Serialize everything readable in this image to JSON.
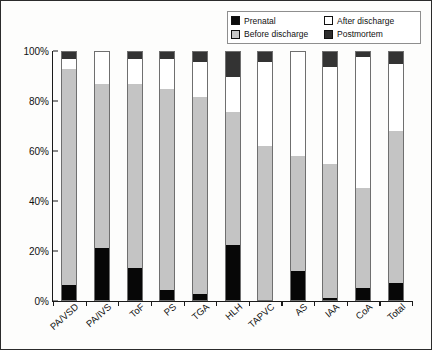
{
  "chart_data": {
    "type": "bar",
    "stacked": true,
    "stack_mode": "percent",
    "title": "",
    "xlabel": "",
    "ylabel": "",
    "ylim": [
      0,
      100
    ],
    "yticks": [
      "0%",
      "20%",
      "40%",
      "60%",
      "80%",
      "100%"
    ],
    "ytick_values": [
      0,
      20,
      40,
      60,
      80,
      100
    ],
    "grid": false,
    "legend_position": "top-right",
    "categories": [
      "PA/VSD",
      "PA/IVS",
      "ToF",
      "PS",
      "TGA",
      "HLH",
      "TAPVC",
      "AS",
      "IAA",
      "CoA",
      "Total"
    ],
    "series": [
      {
        "name": "Prenatal",
        "color": "#070707",
        "values": [
          6,
          21,
          13,
          4,
          2.5,
          22,
          0,
          11.5,
          1,
          5,
          7
        ]
      },
      {
        "name": "Before discharge",
        "color": "#c4c4c4",
        "values": [
          87,
          66,
          74,
          81,
          79.5,
          54,
          62,
          46.5,
          54,
          40,
          61
        ]
      },
      {
        "name": "After discharge",
        "color": "#ffffff",
        "values": [
          4,
          13,
          10,
          12,
          14,
          14,
          34,
          42,
          39,
          53,
          27
        ]
      },
      {
        "name": "Postmortem",
        "color": "#333333",
        "values": [
          3,
          0,
          3,
          3,
          4,
          10,
          4,
          0,
          6,
          2,
          5
        ]
      }
    ]
  },
  "legend": {
    "items": [
      {
        "label": "Prenatal",
        "swatch": "sw-prenatal"
      },
      {
        "label": "After discharge",
        "swatch": "sw-after"
      },
      {
        "label": "Before discharge",
        "swatch": "sw-before"
      },
      {
        "label": "Postmortem",
        "swatch": "sw-post"
      }
    ]
  }
}
